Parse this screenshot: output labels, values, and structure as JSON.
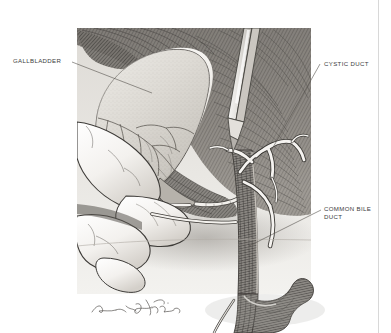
{
  "figure": {
    "kind": "medical-illustration",
    "style": "pen-and-ink stipple / line engraving, grayscale",
    "panel": {
      "background_tone": "#e8e6e2",
      "tissue_tone": "#8d8a85",
      "highlight_tone": "#f4f2ee",
      "ink_tone": "#3a3a3a"
    },
    "annotations": [
      {
        "id": "gallbladder",
        "text": "GALLBLADDER",
        "side": "left",
        "leader_from": [
          72,
          62
        ],
        "leader_to": [
          152,
          93
        ]
      },
      {
        "id": "cystic-duct",
        "text": "CYSTIC DUCT",
        "side": "right",
        "leader_from": [
          320,
          64
        ],
        "leader_to": [
          271,
          151
        ]
      },
      {
        "id": "common-bile-duct",
        "text": "COMMON BILE\nDUCT",
        "side": "right",
        "leader_from": [
          321,
          210
        ],
        "leader_to": [
          249,
          246
        ]
      }
    ],
    "signature": {
      "text": "artist-signature-cursive",
      "position": [
        92,
        308
      ]
    },
    "border": {
      "right_rule_x": 378,
      "color": "#d8d8d8"
    }
  }
}
